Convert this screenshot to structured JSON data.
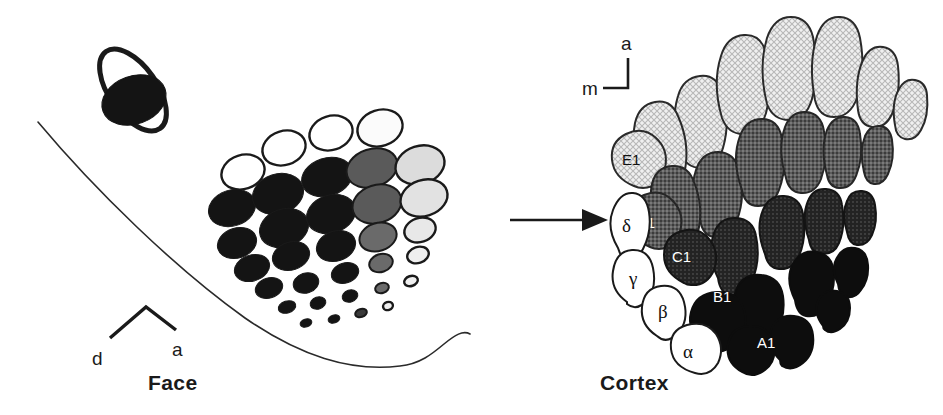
{
  "figure": {
    "type": "diagram",
    "panels": [
      {
        "id": "face",
        "label": "Face"
      },
      {
        "id": "cortex",
        "label": "Cortex"
      }
    ],
    "connector": {
      "name": "arrow",
      "direction": "left-to-right"
    }
  },
  "face": {
    "label": "Face",
    "axis": {
      "left_label": "d",
      "right_label": "a",
      "shape": "caret"
    },
    "eye": {
      "name": "eye-ellipse",
      "outline": "#1a1a1a",
      "fill": "#141414"
    },
    "outline_name": "face-contour",
    "rows": [
      {
        "name": "E",
        "shade": "#e8e8e8"
      },
      {
        "name": "D",
        "shade": "#6e6e6e"
      },
      {
        "name": "C",
        "shade": "#2a2a2a"
      },
      {
        "name": "B",
        "shade": "#141414"
      },
      {
        "name": "A",
        "shade": "#141414"
      }
    ],
    "follicles": [
      {
        "cx": 243,
        "cy": 172,
        "rx": 22,
        "ry": 17,
        "rot": -18,
        "fill": "#ffffff"
      },
      {
        "cx": 284,
        "cy": 148,
        "rx": 22,
        "ry": 17,
        "rot": -18,
        "fill": "#ffffff"
      },
      {
        "cx": 331,
        "cy": 133,
        "rx": 22,
        "ry": 17,
        "rot": -18,
        "fill": "#ffffff"
      },
      {
        "cx": 380,
        "cy": 128,
        "rx": 23,
        "ry": 18,
        "rot": -18,
        "fill": "#fbfbfb"
      },
      {
        "cx": 232,
        "cy": 208,
        "rx": 24,
        "ry": 18,
        "rot": -18,
        "fill": "#141414"
      },
      {
        "cx": 278,
        "cy": 194,
        "rx": 26,
        "ry": 20,
        "rot": -18,
        "fill": "#141414"
      },
      {
        "cx": 327,
        "cy": 177,
        "rx": 26,
        "ry": 19,
        "rot": -18,
        "fill": "#141414"
      },
      {
        "cx": 372,
        "cy": 168,
        "rx": 26,
        "ry": 19,
        "rot": -18,
        "fill": "#5a5a5a"
      },
      {
        "cx": 420,
        "cy": 165,
        "rx": 25,
        "ry": 19,
        "rot": -18,
        "fill": "#dcdcdc"
      },
      {
        "cx": 237,
        "cy": 243,
        "rx": 20,
        "ry": 15,
        "rot": -18,
        "fill": "#141414"
      },
      {
        "cx": 284,
        "cy": 228,
        "rx": 25,
        "ry": 19,
        "rot": -18,
        "fill": "#141414"
      },
      {
        "cx": 331,
        "cy": 214,
        "rx": 25,
        "ry": 19,
        "rot": -18,
        "fill": "#141414"
      },
      {
        "cx": 377,
        "cy": 204,
        "rx": 25,
        "ry": 19,
        "rot": -18,
        "fill": "#5a5a5a"
      },
      {
        "cx": 424,
        "cy": 198,
        "rx": 24,
        "ry": 18,
        "rot": -18,
        "fill": "#e2e2e2"
      },
      {
        "cx": 252,
        "cy": 268,
        "rx": 18,
        "ry": 13,
        "rot": -18,
        "fill": "#141414"
      },
      {
        "cx": 291,
        "cy": 256,
        "rx": 19,
        "ry": 14,
        "rot": -18,
        "fill": "#141414"
      },
      {
        "cx": 336,
        "cy": 246,
        "rx": 20,
        "ry": 15,
        "rot": -18,
        "fill": "#141414"
      },
      {
        "cx": 378,
        "cy": 237,
        "rx": 19,
        "ry": 14,
        "rot": -18,
        "fill": "#6a6a6a"
      },
      {
        "cx": 420,
        "cy": 230,
        "rx": 16,
        "ry": 12,
        "rot": -18,
        "fill": "#e8e8e8"
      },
      {
        "cx": 269,
        "cy": 288,
        "rx": 14,
        "ry": 10,
        "rot": -18,
        "fill": "#141414"
      },
      {
        "cx": 306,
        "cy": 283,
        "rx": 13,
        "ry": 10,
        "rot": -18,
        "fill": "#141414"
      },
      {
        "cx": 345,
        "cy": 273,
        "rx": 14,
        "ry": 10,
        "rot": -18,
        "fill": "#141414"
      },
      {
        "cx": 381,
        "cy": 263,
        "rx": 12,
        "ry": 9,
        "rot": -18,
        "fill": "#6a6a6a"
      },
      {
        "cx": 418,
        "cy": 255,
        "rx": 11,
        "ry": 8,
        "rot": -18,
        "fill": "#efefef"
      },
      {
        "cx": 287,
        "cy": 307,
        "rx": 9,
        "ry": 6,
        "rot": -18,
        "fill": "#141414"
      },
      {
        "cx": 318,
        "cy": 303,
        "rx": 8,
        "ry": 6,
        "rot": -18,
        "fill": "#141414"
      },
      {
        "cx": 350,
        "cy": 296,
        "rx": 8,
        "ry": 6,
        "rot": -18,
        "fill": "#141414"
      },
      {
        "cx": 382,
        "cy": 288,
        "rx": 7,
        "ry": 5,
        "rot": -18,
        "fill": "#6a6a6a"
      },
      {
        "cx": 411,
        "cy": 281,
        "rx": 7,
        "ry": 5,
        "rot": -18,
        "fill": "#efefef"
      },
      {
        "cx": 306,
        "cy": 323,
        "rx": 6,
        "ry": 4,
        "rot": -18,
        "fill": "#141414"
      },
      {
        "cx": 334,
        "cy": 319,
        "rx": 6,
        "ry": 4,
        "rot": -18,
        "fill": "#141414"
      },
      {
        "cx": 361,
        "cy": 313,
        "rx": 6,
        "ry": 4,
        "rot": -18,
        "fill": "#3a3a3a"
      },
      {
        "cx": 388,
        "cy": 306,
        "rx": 5,
        "ry": 4,
        "rot": -18,
        "fill": "#efefef"
      }
    ]
  },
  "cortex": {
    "label": "Cortex",
    "axis": {
      "vertical_label": "a",
      "horizontal_label": "m",
      "shape": "corner"
    },
    "rows": [
      {
        "name": "E",
        "shade": "#e3e3e3"
      },
      {
        "name": "D",
        "shade": "#555555"
      },
      {
        "name": "C",
        "shade": "#3a3a3a"
      },
      {
        "name": "B",
        "shade": "#0d0d0d"
      },
      {
        "name": "A",
        "shade": "#0d0d0d"
      }
    ],
    "straddlers": [
      {
        "label": "α",
        "name": "barrel-alpha"
      },
      {
        "label": "β",
        "name": "barrel-beta"
      },
      {
        "label": "γ",
        "name": "barrel-gamma"
      },
      {
        "label": "δ",
        "name": "barrel-delta"
      }
    ],
    "labeled_barrels": [
      {
        "label": "A1",
        "name": "barrel-a1",
        "text_color": "#ffffff"
      },
      {
        "label": "B1",
        "name": "barrel-b1",
        "text_color": "#ffffff"
      },
      {
        "label": "C1",
        "name": "barrel-c1",
        "text_color": "#ffffff"
      },
      {
        "label": "D1",
        "name": "barrel-d1",
        "text_color": "#ffffff"
      },
      {
        "label": "E1",
        "name": "barrel-e1",
        "text_color": "#111111"
      }
    ]
  }
}
